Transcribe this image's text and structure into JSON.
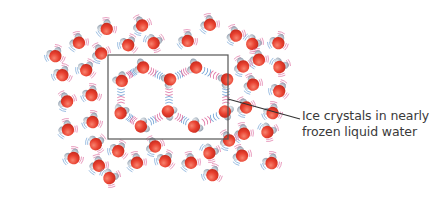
{
  "figure": {
    "label_line1": "Ice crystals in nearly",
    "label_line2": "frozen liquid water",
    "colors": {
      "background": "#ffffff",
      "oxygen": "#e8402f",
      "oxygen_highlight": "#f7836f",
      "hydrogen": "#c4ccd4",
      "hydrogen_shadow": "#8a98a8",
      "bond_pink": "#e07aa8",
      "bond_blue": "#7aa8d8",
      "frame": "#555555",
      "leader_line": "#333333"
    },
    "highlight_box": {
      "x": 108,
      "y": 55,
      "width": 120,
      "height": 84
    },
    "leader_line": {
      "x1": 228,
      "y1": 99,
      "x2": 300,
      "y2": 119
    },
    "hexagon_molecules": [
      {
        "x": 142,
        "y": 67,
        "a": 200
      },
      {
        "x": 121,
        "y": 80,
        "a": 230
      },
      {
        "x": 121,
        "y": 112,
        "a": 290
      },
      {
        "x": 142,
        "y": 126,
        "a": 340
      },
      {
        "x": 169,
        "y": 112,
        "a": 30
      },
      {
        "x": 169,
        "y": 80,
        "a": 150
      },
      {
        "x": 195,
        "y": 67,
        "a": 200
      },
      {
        "x": 226,
        "y": 80,
        "a": 150
      },
      {
        "x": 226,
        "y": 112,
        "a": 20
      },
      {
        "x": 195,
        "y": 126,
        "a": 330
      }
    ],
    "hexagon_bonds": [
      [
        0,
        1
      ],
      [
        1,
        2
      ],
      [
        2,
        3
      ],
      [
        3,
        4
      ],
      [
        4,
        5
      ],
      [
        5,
        0
      ],
      [
        5,
        6
      ],
      [
        6,
        7
      ],
      [
        7,
        8
      ],
      [
        8,
        9
      ],
      [
        9,
        4
      ]
    ],
    "loose_molecules": [
      {
        "x": 55,
        "y": 55,
        "a": 250
      },
      {
        "x": 78,
        "y": 42,
        "a": 220
      },
      {
        "x": 100,
        "y": 53,
        "a": 200
      },
      {
        "x": 106,
        "y": 28,
        "a": 230
      },
      {
        "x": 128,
        "y": 44,
        "a": 260
      },
      {
        "x": 141,
        "y": 25,
        "a": 200
      },
      {
        "x": 154,
        "y": 42,
        "a": 290
      },
      {
        "x": 187,
        "y": 40,
        "a": 230
      },
      {
        "x": 209,
        "y": 24,
        "a": 220
      },
      {
        "x": 235,
        "y": 35,
        "a": 210
      },
      {
        "x": 253,
        "y": 43,
        "a": 310
      },
      {
        "x": 278,
        "y": 42,
        "a": 250
      },
      {
        "x": 258,
        "y": 59,
        "a": 220
      },
      {
        "x": 280,
        "y": 66,
        "a": 300
      },
      {
        "x": 242,
        "y": 66,
        "a": 200
      },
      {
        "x": 62,
        "y": 74,
        "a": 250
      },
      {
        "x": 86,
        "y": 69,
        "a": 260
      },
      {
        "x": 91,
        "y": 94,
        "a": 240
      },
      {
        "x": 66,
        "y": 101,
        "a": 200
      },
      {
        "x": 92,
        "y": 121,
        "a": 240
      },
      {
        "x": 67,
        "y": 129,
        "a": 220
      },
      {
        "x": 96,
        "y": 143,
        "a": 280
      },
      {
        "x": 252,
        "y": 84,
        "a": 210
      },
      {
        "x": 279,
        "y": 90,
        "a": 260
      },
      {
        "x": 245,
        "y": 107,
        "a": 200
      },
      {
        "x": 272,
        "y": 112,
        "a": 240
      },
      {
        "x": 243,
        "y": 133,
        "a": 220
      },
      {
        "x": 268,
        "y": 131,
        "a": 300
      },
      {
        "x": 241,
        "y": 155,
        "a": 210
      },
      {
        "x": 271,
        "y": 162,
        "a": 240
      },
      {
        "x": 73,
        "y": 157,
        "a": 240
      },
      {
        "x": 98,
        "y": 165,
        "a": 220
      },
      {
        "x": 110,
        "y": 177,
        "a": 300
      },
      {
        "x": 118,
        "y": 150,
        "a": 260
      },
      {
        "x": 136,
        "y": 162,
        "a": 220
      },
      {
        "x": 154,
        "y": 146,
        "a": 200
      },
      {
        "x": 165,
        "y": 160,
        "a": 260
      },
      {
        "x": 190,
        "y": 162,
        "a": 220
      },
      {
        "x": 210,
        "y": 152,
        "a": 300
      },
      {
        "x": 212,
        "y": 174,
        "a": 250
      },
      {
        "x": 228,
        "y": 140,
        "a": 200
      }
    ]
  }
}
